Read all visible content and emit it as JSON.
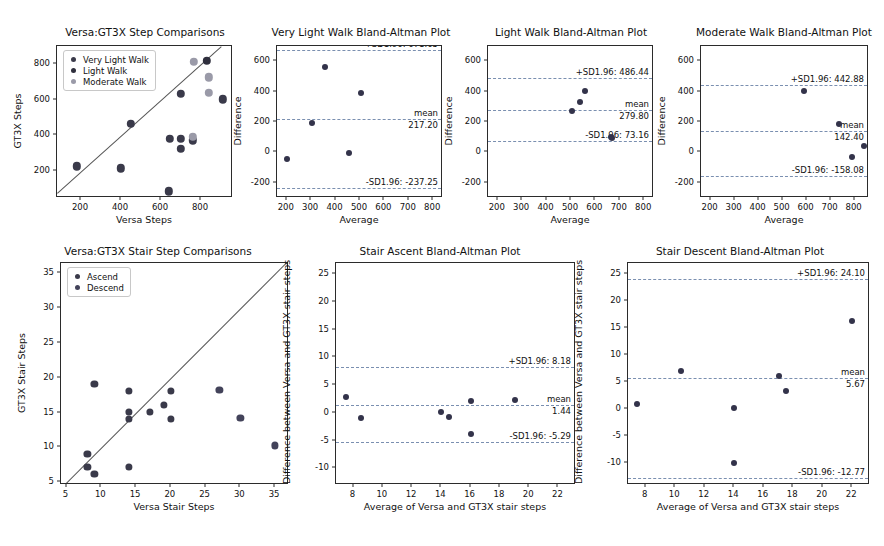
{
  "figure": {
    "width": 884,
    "height": 546,
    "background": "#ffffff",
    "colors": {
      "very_light_walk": "#3a3a4a",
      "light_walk": "#2f2f3d",
      "moderate_walk": "#9a9aa8",
      "ascend": "#3a3a4a",
      "descend": "#43435a",
      "point": "#33334a",
      "identity_line": "#555555",
      "limit_line": "#7a8fb0",
      "axis": "#2b2b2b",
      "text": "#111111"
    }
  },
  "chart_data": [
    {
      "id": "versa-gt3x-step-comparisons",
      "type": "scatter",
      "title": "Versa:GT3X Step Comparisons",
      "xlabel": "Versa Steps",
      "ylabel": "GT3X Steps",
      "xlim": [
        80,
        960
      ],
      "ylim": [
        50,
        900
      ],
      "xticks": [
        200,
        400,
        600,
        800
      ],
      "yticks": [
        200,
        400,
        600,
        800
      ],
      "grid": false,
      "identity_line": true,
      "legend_position": "upper left",
      "legend": [
        "Very Light Walk",
        "Light Walk",
        "Moderate Walk"
      ],
      "series": [
        {
          "name": "Very Light Walk",
          "color": "#3a3a4a",
          "points": [
            [
              180,
              228
            ],
            [
              400,
              216
            ],
            [
              450,
              465
            ],
            [
              640,
              88
            ],
            [
              700,
              632
            ],
            [
              645,
              380
            ],
            [
              700,
              380
            ],
            [
              700,
              325
            ],
            [
              760,
              372
            ],
            [
              910,
              602
            ]
          ]
        },
        {
          "name": "Light Walk",
          "color": "#2f2f3d",
          "points": [
            [
              830,
              818
            ]
          ]
        },
        {
          "name": "Moderate Walk",
          "color": "#9a9aa8",
          "points": [
            [
              765,
              812
            ],
            [
              760,
              392
            ],
            [
              838,
              726
            ],
            [
              838,
              638
            ]
          ]
        }
      ]
    },
    {
      "id": "very-light-walk-bland-altman",
      "type": "scatter",
      "title": "Very Light Walk Bland-Altman Plot",
      "xlabel": "Average",
      "ylabel": "Difference",
      "xlim": [
        160,
        840
      ],
      "ylim": [
        -300,
        700
      ],
      "xticks": [
        200,
        300,
        400,
        500,
        600,
        700,
        800
      ],
      "yticks": [
        -200,
        0,
        200,
        400,
        600
      ],
      "grid": false,
      "legend_position": "none",
      "mean": 217.2,
      "mean_label": "mean",
      "mean_value_label": "217.20",
      "upper_limit": 671.65,
      "upper_label": "+SD1.96: 671.65",
      "lower_limit": -237.25,
      "lower_label": "-SD1.96: -237.25",
      "points": [
        [
          200,
          -45
        ],
        [
          305,
          193
        ],
        [
          355,
          563
        ],
        [
          455,
          -5
        ],
        [
          505,
          392
        ]
      ]
    },
    {
      "id": "light-walk-bland-altman",
      "type": "scatter",
      "title": "Light Walk Bland-Altman Plot",
      "xlabel": "Average",
      "ylabel": "Difference",
      "xlim": [
        160,
        840
      ],
      "ylim": [
        -300,
        700
      ],
      "xticks": [
        200,
        300,
        400,
        500,
        600,
        700,
        800
      ],
      "yticks": [
        -200,
        0,
        200,
        400,
        600
      ],
      "grid": false,
      "legend_position": "none",
      "mean": 279.8,
      "mean_label": "mean",
      "mean_value_label": "279.80",
      "upper_limit": 486.44,
      "upper_label": "+SD1.96: 486.44",
      "lower_limit": 73.16,
      "lower_label": "-SD1.96: 73.16",
      "points": [
        [
          503,
          272
        ],
        [
          535,
          332
        ],
        [
          557,
          405
        ],
        [
          665,
          100
        ],
        [
          668,
          92
        ]
      ]
    },
    {
      "id": "moderate-walk-bland-altman",
      "type": "scatter",
      "title": "Moderate Walk Bland-Altman Plot",
      "xlabel": "Average",
      "ylabel": "Difference",
      "xlim": [
        160,
        860
      ],
      "ylim": [
        -300,
        700
      ],
      "xticks": [
        200,
        300,
        400,
        500,
        600,
        700,
        800
      ],
      "yticks": [
        -200,
        0,
        200,
        400,
        600
      ],
      "grid": false,
      "legend_position": "none",
      "mean": 142.4,
      "mean_label": "mean",
      "mean_value_label": "142.40",
      "upper_limit": 442.88,
      "upper_label": "+SD1.96: 442.88",
      "lower_limit": -158.08,
      "lower_label": "-SD1.96: -158.08",
      "points": [
        [
          590,
          405
        ],
        [
          735,
          188
        ],
        [
          790,
          -30
        ],
        [
          840,
          42
        ]
      ]
    },
    {
      "id": "versa-gt3x-stair-step-comparisons",
      "type": "scatter",
      "title": "Versa:GT3X Stair Step Comparisons",
      "xlabel": "Versa Stair Steps",
      "ylabel": "GT3X Stair Steps",
      "xlim": [
        4.2,
        37
      ],
      "ylim": [
        4.6,
        36.5
      ],
      "xticks": [
        5,
        10,
        15,
        20,
        25,
        30,
        35
      ],
      "yticks": [
        5,
        10,
        15,
        20,
        25,
        30,
        35
      ],
      "grid": false,
      "identity_line": true,
      "legend_position": "upper left",
      "legend": [
        "Ascend",
        "Descend"
      ],
      "series": [
        {
          "name": "Ascend",
          "color": "#3a3a4a",
          "points": [
            [
              8,
              9.1
            ],
            [
              8,
              7.2
            ],
            [
              9,
              6.2
            ],
            [
              9,
              19.1
            ],
            [
              14,
              15.1
            ],
            [
              14,
              14.1
            ],
            [
              14,
              18.1
            ],
            [
              14,
              7.2
            ],
            [
              17,
              15.1
            ],
            [
              19,
              16.1
            ],
            [
              20,
              18.1
            ],
            [
              20,
              14.1
            ]
          ]
        },
        {
          "name": "Descend",
          "color": "#43435a",
          "points": [
            [
              27,
              18.3
            ],
            [
              30,
              14.2
            ],
            [
              35,
              10.3
            ]
          ]
        }
      ]
    },
    {
      "id": "stair-ascent-bland-altman",
      "type": "scatter",
      "title": "Stair Ascent Bland-Altman Plot",
      "xlabel": "Average of Versa and GT3X stair steps",
      "ylabel": "Difference between Versa and GT3X stair steps",
      "xlim": [
        6.8,
        23.2
      ],
      "ylim": [
        -13,
        27
      ],
      "xticks": [
        8,
        10,
        12,
        14,
        16,
        18,
        20,
        22
      ],
      "yticks": [
        -10,
        -5,
        0,
        5,
        10,
        15,
        20,
        25
      ],
      "grid": false,
      "legend_position": "none",
      "mean": 1.44,
      "mean_label": "mean",
      "mean_value_label": "1.44",
      "upper_limit": 8.18,
      "upper_label": "+SD1.96: 8.18",
      "lower_limit": -5.29,
      "lower_label": "-SD1.96: -5.29",
      "points": [
        [
          7.5,
          2.9
        ],
        [
          8.5,
          -1.0
        ],
        [
          14.0,
          0.2
        ],
        [
          14.5,
          -0.7
        ],
        [
          16.0,
          2.2
        ],
        [
          16.0,
          -3.8
        ],
        [
          19.0,
          2.3
        ]
      ]
    },
    {
      "id": "stair-descent-bland-altman",
      "type": "scatter",
      "title": "Stair Descent Bland-Altman Plot",
      "xlabel": "Average of Versa and GT3X stair steps",
      "ylabel": "Difference between Versa and GT3X stair steps",
      "xlim": [
        6.8,
        23.2
      ],
      "ylim": [
        -14,
        27
      ],
      "xticks": [
        8,
        10,
        12,
        14,
        16,
        18,
        20,
        22
      ],
      "yticks": [
        -10,
        -5,
        0,
        5,
        10,
        15,
        20,
        25
      ],
      "grid": false,
      "legend_position": "none",
      "mean": 5.67,
      "mean_label": "mean",
      "mean_value_label": "5.67",
      "upper_limit": 24.1,
      "upper_label": "+SD1.96: 24.10",
      "lower_limit": -12.77,
      "lower_label": "-SD1.96: -12.77",
      "points": [
        [
          7.4,
          1.0
        ],
        [
          10.4,
          7.0
        ],
        [
          14.0,
          0.2
        ],
        [
          14.0,
          -10.0
        ],
        [
          17.0,
          6.1
        ],
        [
          17.5,
          3.3
        ],
        [
          22.0,
          16.3
        ]
      ]
    }
  ]
}
